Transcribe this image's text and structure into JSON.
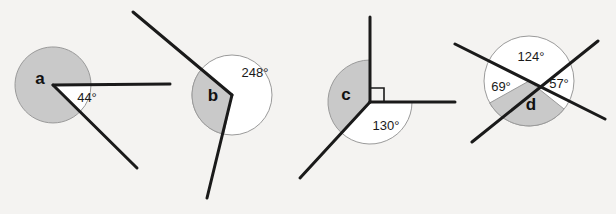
{
  "page": {
    "background_color": "#f4f3f1",
    "shaded_fill_color": "#c9c9c9",
    "unshaded_fill_color": "#ffffff",
    "outline_color": "#9a9a9a",
    "ray_color": "#1a1a1a",
    "text_color": "#1a1a1a"
  },
  "figures": [
    {
      "id": "a",
      "letter": "a",
      "letter_position": {
        "x": 40,
        "y": 84
      },
      "vertex": {
        "x": 53,
        "y": 85
      },
      "circle_radius": 38,
      "shaded_region_label": "a",
      "shaded_is_reflex": true,
      "marked_angle": {
        "value": "44°",
        "degrees": 44,
        "label_position": {
          "x": 87,
          "y": 102
        },
        "shaded": false
      },
      "rays": [
        {
          "name": "ray-horizontal-right",
          "to": {
            "x": 170,
            "y": 84
          },
          "angle_deg": 0
        },
        {
          "name": "ray-lower-right",
          "to": {
            "x": 137,
            "y": 168
          },
          "angle_deg": -44
        }
      ]
    },
    {
      "id": "b",
      "letter": "b",
      "letter_position": {
        "x": 213,
        "y": 99
      },
      "vertex": {
        "x": 232,
        "y": 95
      },
      "circle_radius": 40,
      "shaded_region_label": "b",
      "shaded_is_reflex": false,
      "marked_angle": {
        "value": "248°",
        "degrees": 248,
        "label_position": {
          "x": 254,
          "y": 73
        },
        "shaded": false
      },
      "rays": [
        {
          "name": "ray-upper-left",
          "to": {
            "x": 133,
            "y": 12
          },
          "angle_deg": 140
        },
        {
          "name": "ray-lower",
          "to": {
            "x": 207,
            "y": 198
          },
          "angle_deg": -102
        }
      ]
    },
    {
      "id": "c",
      "letter": "c",
      "letter_position": {
        "x": 345,
        "y": 97
      },
      "vertex": {
        "x": 370,
        "y": 102
      },
      "circle_radius": 42,
      "shaded_region_label": "c",
      "shaded_is_reflex": true,
      "right_angle_marker": true,
      "marked_angle": {
        "value": "130°",
        "degrees": 130,
        "label_position": {
          "x": 383,
          "y": 127
        },
        "shaded": false
      },
      "rays": [
        {
          "name": "ray-up",
          "to": {
            "x": 370,
            "y": 17
          },
          "angle_deg": 90
        },
        {
          "name": "ray-right",
          "to": {
            "x": 455,
            "y": 102
          },
          "angle_deg": 0
        },
        {
          "name": "ray-lower-left",
          "to": {
            "x": 300,
            "y": 178
          },
          "angle_deg": -133
        }
      ]
    },
    {
      "id": "d",
      "letter": "d",
      "letter_position": {
        "x": 530,
        "y": 104
      },
      "vertex": {
        "x": 529,
        "y": 81
      },
      "circle_radius": 45,
      "shaded_region_label": "d",
      "shaded_is_reflex": false,
      "marked_angles": [
        {
          "value": "124°",
          "degrees": 124,
          "label_position": {
            "x": 529,
            "y": 56
          },
          "shaded": false
        },
        {
          "value": "69°",
          "degrees": 69,
          "label_position": {
            "x": 501,
            "y": 86
          },
          "shaded": false
        },
        {
          "value": "57°",
          "degrees": 57,
          "label_position": {
            "x": 557,
            "y": 84
          },
          "shaded": false
        }
      ],
      "lines": [
        {
          "name": "line-down-right",
          "from": {
            "x": 455,
            "y": 44
          },
          "to": {
            "x": 605,
            "y": 119
          }
        },
        {
          "name": "line-up-right",
          "from": {
            "x": 472,
            "y": 142
          },
          "to": {
            "x": 598,
            "y": 41
          }
        }
      ]
    }
  ]
}
